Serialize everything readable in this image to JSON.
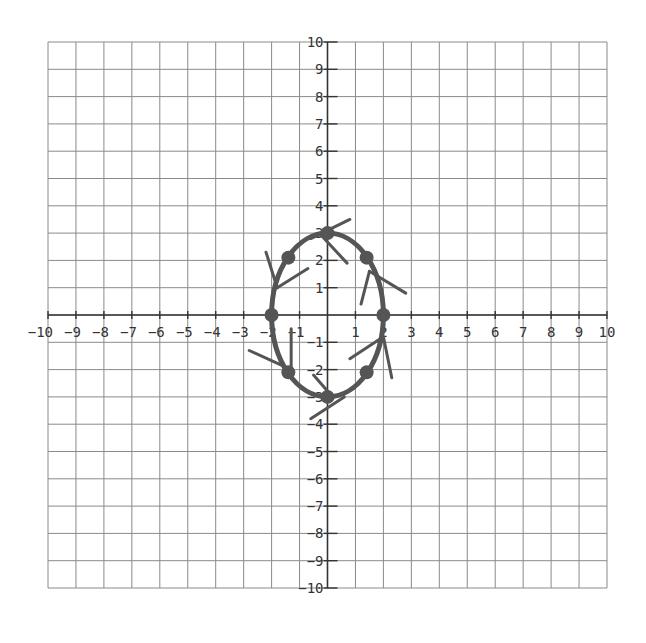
{
  "chart_data": {
    "type": "line",
    "title": "",
    "xlabel": "",
    "ylabel": "",
    "xlim": [
      -10,
      10
    ],
    "ylim": [
      -10,
      10
    ],
    "grid": true,
    "x_ticks": [
      -10,
      -9,
      -8,
      -7,
      -6,
      -5,
      -4,
      -3,
      -2,
      -1,
      1,
      2,
      3,
      4,
      5,
      6,
      7,
      8,
      9,
      10
    ],
    "y_ticks": [
      -10,
      -9,
      -8,
      -7,
      -6,
      -5,
      -4,
      -3,
      -2,
      -1,
      1,
      2,
      3,
      4,
      5,
      6,
      7,
      8,
      9,
      10
    ],
    "series": [
      {
        "name": "ellipse",
        "kind": "curve",
        "equation": "x^2/4 + y^2/9 = 1",
        "center": [
          0,
          0
        ],
        "semi_axis_x": 2,
        "semi_axis_y": 3
      },
      {
        "name": "marked points",
        "kind": "scatter",
        "points": [
          [
            0,
            3
          ],
          [
            1.4,
            2.1
          ],
          [
            2,
            0
          ],
          [
            1.4,
            -2.1
          ],
          [
            0,
            -3
          ],
          [
            -1.4,
            -2.1
          ],
          [
            -2,
            0
          ],
          [
            -1.4,
            2.1
          ]
        ]
      },
      {
        "name": "segments",
        "kind": "segments",
        "lines": [
          [
            [
              -0.6,
              2.8
            ],
            [
              0.8,
              3.5
            ]
          ],
          [
            [
              -0.3,
              3.0
            ],
            [
              0.7,
              1.9
            ]
          ],
          [
            [
              1.5,
              1.6
            ],
            [
              2.8,
              0.8
            ]
          ],
          [
            [
              1.5,
              1.6
            ],
            [
              1.2,
              0.4
            ]
          ],
          [
            [
              -1.8,
              1.0
            ],
            [
              -2.2,
              2.3
            ]
          ],
          [
            [
              -1.8,
              1.0
            ],
            [
              -0.7,
              1.7
            ]
          ],
          [
            [
              -1.3,
              -2.0
            ],
            [
              -2.8,
              -1.3
            ]
          ],
          [
            [
              -1.3,
              -2.0
            ],
            [
              -1.3,
              -0.5
            ]
          ],
          [
            [
              0.1,
              -2.9
            ],
            [
              -0.5,
              -2.2
            ]
          ],
          [
            [
              0.6,
              -3.0
            ],
            [
              -0.6,
              -3.8
            ]
          ],
          [
            [
              2.0,
              -0.8
            ],
            [
              0.8,
              -1.6
            ]
          ],
          [
            [
              2.0,
              -0.8
            ],
            [
              2.3,
              -2.3
            ]
          ]
        ]
      }
    ]
  },
  "colors": {
    "grid": "#8a8a8a",
    "axis": "#333333",
    "curve": "#555555",
    "points": "#555555"
  }
}
